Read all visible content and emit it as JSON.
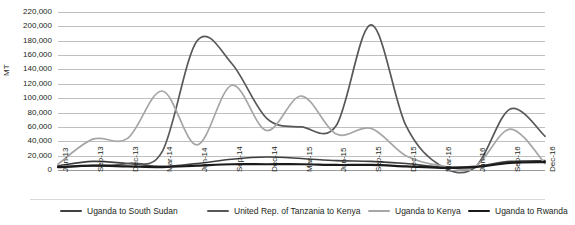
{
  "chart_data": {
    "type": "line",
    "title": "",
    "xlabel": "",
    "ylabel": "MT",
    "ylim": [
      0,
      220000
    ],
    "ytick_step": 20000,
    "grid": true,
    "grid_axis": "y",
    "legend_position": "bottom",
    "yticks": [
      "220,000",
      "200,000",
      "180,000",
      "160,000",
      "140,000",
      "120,000",
      "100,000",
      "80,000",
      "60,000",
      "40,000",
      "20,000",
      "0"
    ],
    "ytick_values": [
      220000,
      200000,
      180000,
      160000,
      140000,
      120000,
      100000,
      80000,
      60000,
      40000,
      20000,
      0
    ],
    "categories": [
      "Jun-13",
      "Sep-13",
      "Dec-13",
      "Mar-14",
      "Jun-14",
      "Sep-14",
      "Dec-14",
      "Mar-15",
      "Jun-15",
      "Sep-15",
      "Dec-15",
      "Mar-16",
      "Jun-16",
      "Sep-16",
      "Dec-16"
    ],
    "series": [
      {
        "name": "Uganda to South Sudan",
        "color": "#404040",
        "width": 1.6,
        "values": [
          6000,
          12000,
          9000,
          5000,
          9000,
          15000,
          18000,
          16000,
          13000,
          12000,
          9000,
          4000,
          5000,
          12000,
          13000
        ]
      },
      {
        "name": "United Rep. of Tanzania to Kenya",
        "color": "#585858",
        "width": 1.7,
        "values": [
          4000,
          6000,
          9000,
          26000,
          180000,
          148000,
          72000,
          60000,
          62000,
          202000,
          62000,
          6000,
          4000,
          85000,
          47000
        ]
      },
      {
        "name": "Uganda to Kenya",
        "color": "#a6a6a6",
        "width": 1.7,
        "values": [
          8000,
          43000,
          44000,
          110000,
          35000,
          118000,
          55000,
          103000,
          50000,
          58000,
          20000,
          6000,
          5000,
          57000,
          9000
        ]
      },
      {
        "name": "Uganda to Rwanda",
        "color": "#1a1a1a",
        "width": 2.2,
        "values": [
          4000,
          6000,
          5000,
          4000,
          6000,
          8000,
          8000,
          8000,
          7000,
          7000,
          5000,
          3000,
          4000,
          10000,
          11000
        ]
      }
    ]
  },
  "legend": {
    "items": [
      {
        "label": "Uganda to South Sudan"
      },
      {
        "label": "United Rep. of Tanzania to Kenya"
      },
      {
        "label": "Uganda to Kenya"
      },
      {
        "label": "Uganda to Rwanda"
      }
    ]
  }
}
